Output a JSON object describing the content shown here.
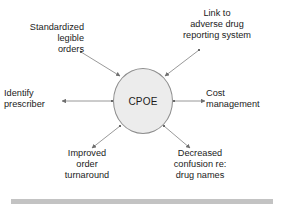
{
  "diagram": {
    "title_node": {
      "label": "CPOE",
      "shape": "ellipse",
      "fill_color": "#ececec",
      "stroke_color": "#8d8d8d"
    },
    "nodes": [
      {
        "id": "standardized-legible-orders",
        "label": "Standardized\nlegible\norders",
        "position": "top-left",
        "align": "right",
        "arrow_direction": "toward-center"
      },
      {
        "id": "link-adverse-drug-reporting",
        "label": "Link to\nadverse drug\nreporting system",
        "position": "top-right",
        "align": "center",
        "arrow_direction": "toward-center"
      },
      {
        "id": "identify-prescriber",
        "label": "Identify\nprescriber",
        "position": "left",
        "align": "left",
        "arrow_direction": "away-from-center"
      },
      {
        "id": "cost-management",
        "label": "Cost\nmanagement",
        "position": "right",
        "align": "left",
        "arrow_direction": "away-from-center"
      },
      {
        "id": "improved-order-turnaround",
        "label": "Improved\norder\nturnaround",
        "position": "bottom-left",
        "align": "center",
        "arrow_direction": "away-from-center"
      },
      {
        "id": "decreased-confusion-drug-names",
        "label": "Decreased\nconfusion re:\ndrug names",
        "position": "bottom-right",
        "align": "center",
        "arrow_direction": "away-from-center"
      }
    ],
    "edge_color": "#8d8d8d",
    "footer_rule_color": "#c3c3c3"
  }
}
